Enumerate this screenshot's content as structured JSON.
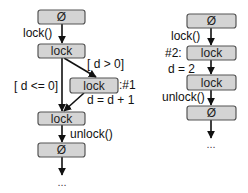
{
  "diagram": {
    "left": {
      "nodes": [
        {
          "id": "l_start",
          "label": "Ø"
        },
        {
          "id": "l_lock1",
          "label": "lock"
        },
        {
          "id": "l_lock_inner",
          "label": "lock"
        },
        {
          "id": "l_lock2",
          "label": "lock"
        },
        {
          "id": "l_end",
          "label": "Ø"
        }
      ],
      "edge_labels": {
        "lock_call": "lock()",
        "cond_true": "[ d > 0]",
        "cond_false": "[ d <= 0]",
        "inner_tag": ":#1",
        "increment": "d = d + 1",
        "unlock_call": "unlock()"
      },
      "continuation": "..."
    },
    "right": {
      "nodes": [
        {
          "id": "r_start",
          "label": "Ø"
        },
        {
          "id": "r_lock1",
          "label": "lock"
        },
        {
          "id": "r_lock2",
          "label": "lock"
        },
        {
          "id": "r_end",
          "label": "Ø"
        }
      ],
      "edge_labels": {
        "lock_call": "lock()",
        "tag": "#2:",
        "assign": "d = 2",
        "unlock_call": "unlock()"
      },
      "continuation": "..."
    },
    "colors": {
      "box_fill": "#d4d4d4",
      "box_stroke": "#555555",
      "edge": "#111111"
    }
  }
}
